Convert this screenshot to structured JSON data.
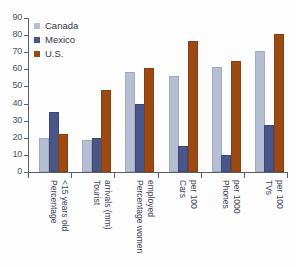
{
  "chart_data": {
    "type": "bar",
    "title": "",
    "xlabel": "",
    "ylabel": "",
    "ylim": [
      0,
      90
    ],
    "ytick_step": 10,
    "yticks": [
      0,
      10,
      20,
      30,
      40,
      50,
      60,
      70,
      80,
      90
    ],
    "grid": false,
    "legend_position": "top-left",
    "categories": [
      "Percentage\n<15 years old",
      "Tourist\narrivals (mm)",
      "Percentage women\nemployed",
      "Cars\nper 100",
      "Phones\nper 1000",
      "TVs\nper 100"
    ],
    "category_lines": [
      [
        "Percentage",
        "<15 years old"
      ],
      [
        "Tourist",
        "arrivals (mm)"
      ],
      [
        "Percentage women",
        "employed"
      ],
      [
        "Cars",
        "per 100"
      ],
      [
        "Phones",
        "per 1000"
      ],
      [
        "TVs",
        "per 100"
      ]
    ],
    "series": [
      {
        "name": "Canada",
        "color": "#b6bed4",
        "values": [
          19,
          17.5,
          57.5,
          55,
          60,
          69.5
        ]
      },
      {
        "name": "Mexico",
        "color": "#4a5687",
        "values": [
          34,
          19,
          38.5,
          14,
          9,
          26.5
        ]
      },
      {
        "name": "U.S.",
        "color": "#9b4a13",
        "values": [
          21,
          47,
          59.5,
          75.5,
          63.5,
          79.5
        ]
      }
    ]
  },
  "axis": {
    "line_color": "#5a5f6e",
    "tick_label_color": "#4a5260"
  },
  "background": "#fdfdfe"
}
